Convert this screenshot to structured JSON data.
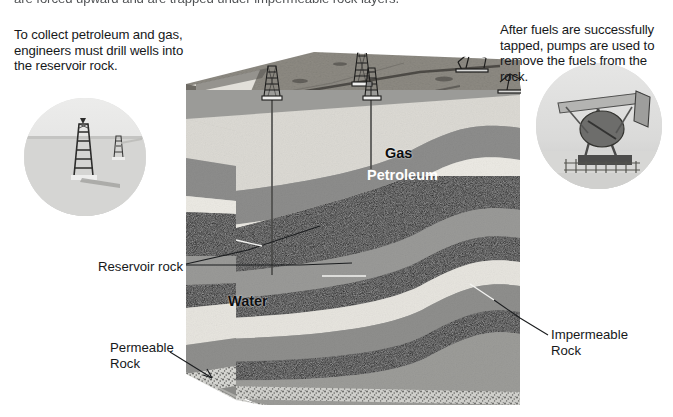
{
  "figure": {
    "background_color": "#ffffff"
  },
  "callouts": {
    "top_clipped": "are forced upward and are trapped under impermeable rock layers.",
    "left": "To collect petroleum and gas, engineers must drill wells into the reservoir rock.",
    "right": "After fuels are successfully tapped, pumps are used to remove the fuels from the rock."
  },
  "labels": {
    "gas": "Gas",
    "petroleum": "Petroleum",
    "water": "Water",
    "reservoir_rock": "Reservoir rock",
    "permeable_rock": "Permeable\nRock",
    "impermeable_rock": "Impermeable\nRock"
  },
  "insets": [
    {
      "name": "drilling-derricks-photo",
      "caption_ref": "left",
      "shape": "circle"
    },
    {
      "name": "pumpjack-photo",
      "caption_ref": "right",
      "shape": "circle"
    }
  ],
  "colors": {
    "text": "#16181a",
    "label_light": "#ffffff",
    "surface_ground": "#8e8b83",
    "layer_light_rock": "#dcdad4",
    "layer_gray_rock": "#8a8a8a",
    "layer_dark_rock": "#0b0b0b",
    "layer_mid_rock": "#a8a8a6",
    "layer_permeable": "#c9c9c7",
    "leader_line": "#1b1d1f"
  },
  "strata": [
    {
      "name": "surface-soil",
      "label": null,
      "fill": "#8e8b83"
    },
    {
      "name": "upper-light-rock",
      "label": null,
      "fill": "#dcdad4"
    },
    {
      "name": "impermeable-caprock-upper",
      "label": "Impermeable Rock",
      "fill": "#8d8d8c"
    },
    {
      "name": "gas-reservoir",
      "label": "Gas",
      "fill": "#eceae4"
    },
    {
      "name": "petroleum-reservoir",
      "label": "Petroleum",
      "fill": "#0d0d0d"
    },
    {
      "name": "mid-gray-rock",
      "label": null,
      "fill": "#9a9a98"
    },
    {
      "name": "dark-shale",
      "label": null,
      "fill": "#101010"
    },
    {
      "name": "water-reservoir",
      "label": "Water",
      "fill": "#e7e5df"
    },
    {
      "name": "lower-gray-rock",
      "label": null,
      "fill": "#8f8f8d"
    },
    {
      "name": "lower-dark-band",
      "label": null,
      "fill": "#121212"
    },
    {
      "name": "basement-gray-rock",
      "label": null,
      "fill": "#9c9c99"
    },
    {
      "name": "permeable-rock-base",
      "label": "Permeable Rock",
      "fill": "#cfcfcb"
    }
  ],
  "wells": [
    {
      "name": "well-1",
      "depth_label": null
    },
    {
      "name": "well-2",
      "depth_label": null
    }
  ],
  "surface_equipment": [
    {
      "name": "derrick-1"
    },
    {
      "name": "derrick-2"
    },
    {
      "name": "derrick-3"
    },
    {
      "name": "pumpjack-1"
    },
    {
      "name": "pumpjack-2"
    }
  ]
}
